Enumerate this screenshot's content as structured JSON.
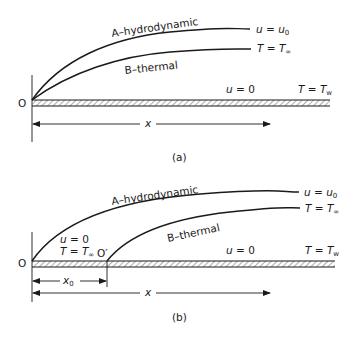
{
  "figure_a": {
    "caption": "(a)",
    "origin_label": "O",
    "curve_a_label": "A–hydrodynamic",
    "curve_b_label": "B–thermal",
    "curve_a_end_label": "u = u0",
    "curve_a_end_var": "u",
    "curve_a_end_eq": " = ",
    "curve_a_end_val": "u",
    "curve_a_end_sub": "0",
    "curve_b_end_var": "T",
    "curve_b_end_eq": " = ",
    "curve_b_end_val": "T",
    "curve_b_end_sub": "∞",
    "wall_velocity_var": "u",
    "wall_velocity_rest": " = 0",
    "wall_temp_var": "T",
    "wall_temp_eq": " = ",
    "wall_temp_val": "T",
    "wall_temp_sub": "w",
    "x_axis_label": "x"
  },
  "figure_b": {
    "caption": "(b)",
    "origin_label": "O",
    "origin_prime_label": "O′",
    "curve_a_label": "A–hydrodynamic",
    "curve_b_label": "B–thermal",
    "curve_a_end_var": "u",
    "curve_a_end_eq": " = ",
    "curve_a_end_val": "u",
    "curve_a_end_sub": "0",
    "curve_b_end_var": "T",
    "curve_b_end_eq": " = ",
    "curve_b_end_val": "T",
    "curve_b_end_sub": "∞",
    "unheated_velocity_var": "u",
    "unheated_velocity_rest": " = 0",
    "unheated_temp_var": "T",
    "unheated_temp_eq": " = ",
    "unheated_temp_val": "T",
    "unheated_temp_sub": "∞",
    "wall_velocity_var": "u",
    "wall_velocity_rest": " = 0",
    "wall_temp_var": "T",
    "wall_temp_eq": " = ",
    "wall_temp_val": "T",
    "wall_temp_sub": "w",
    "x0_label": "x",
    "x0_sub": "0",
    "x_axis_label": "x"
  },
  "colors": {
    "ink": "#1a1a1a",
    "hatch": "#555555",
    "background": "#ffffff"
  }
}
